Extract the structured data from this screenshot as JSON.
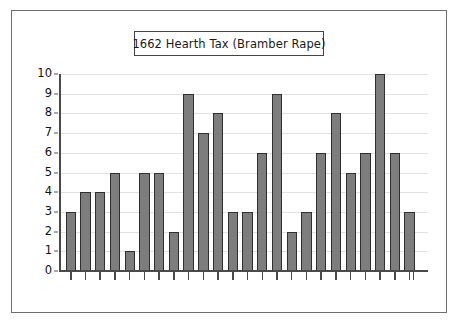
{
  "figure": {
    "title": "1662 Hearth Tax (Bramber Rape)",
    "border_color": "#6e6e6e",
    "background": "#ffffff"
  },
  "chart_data": {
    "type": "bar",
    "title": "1662 Hearth Tax (Bramber Rape)",
    "xlabel": "",
    "ylabel": "",
    "ylim": [
      0,
      10
    ],
    "yticks": [
      0,
      1,
      2,
      3,
      4,
      5,
      6,
      7,
      8,
      9,
      10
    ],
    "ytick_labels": [
      "0",
      "1",
      "2",
      "3",
      "4",
      "5",
      "6",
      "7",
      "8",
      "9",
      "10"
    ],
    "grid": true,
    "grid_axis": "y",
    "legend": false,
    "xtick_labels": [],
    "categories": [
      "1",
      "2",
      "3",
      "4",
      "5",
      "6",
      "7",
      "8",
      "9",
      "10",
      "11",
      "12",
      "13",
      "14",
      "15",
      "16",
      "17",
      "18",
      "19",
      "20",
      "21",
      "22",
      "23",
      "24"
    ],
    "values": [
      3,
      4,
      4,
      5,
      1,
      5,
      5,
      2,
      9,
      7,
      8,
      3,
      3,
      6,
      9,
      2,
      3,
      6,
      8,
      5,
      6,
      10,
      6,
      3
    ],
    "bar_color": "#7d7d7d",
    "bar_edge_color": "#2f2f2f",
    "grid_color": "#e2e2e2",
    "axis_color": "#4a4a4a"
  }
}
